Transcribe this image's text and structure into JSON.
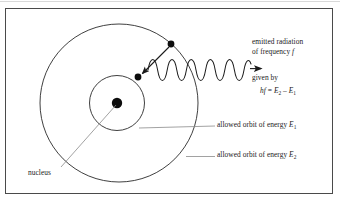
{
  "figure": {
    "background_color": "#ffffff",
    "frame_color": "#4a4a4a",
    "ink_color": "#1a1a1a",
    "leader_color": "#8a8a8a"
  },
  "labels": {
    "emitted_line1": "emitted radiation",
    "emitted_line2_prefix": "of frequency ",
    "emitted_line2_symbol": "f",
    "given_by": "given by",
    "formula": {
      "lhs_h": "h",
      "lhs_f": "f",
      "equals": " = ",
      "term1_base": "E",
      "term1_sub": "2",
      "minus": " – ",
      "term2_base": "E",
      "term2_sub": "1"
    },
    "orbit_e1_text": "allowed orbit of energy ",
    "orbit_e1_symbol": "E",
    "orbit_e1_sub": "1",
    "orbit_e2_text": "allowed orbit of energy ",
    "orbit_e2_symbol": "E",
    "orbit_e2_sub": "2",
    "nucleus": "nucleus"
  },
  "diagram": {
    "nucleus_dot": {
      "cx": 117,
      "cy": 103,
      "r": 5.2
    },
    "inner_orbit": {
      "cx": 117,
      "cy": 103,
      "r": 27.5
    },
    "outer_orbit": {
      "cx": 119,
      "cy": 103,
      "r": 79
    },
    "electron_outer": {
      "cx": 171,
      "cy": 44,
      "r": 3.4
    },
    "electron_inner": {
      "cx": 138,
      "cy": 77,
      "r": 3.4
    },
    "transition_arrow": {
      "x1": 169,
      "y1": 47,
      "x2": 140,
      "y2": 75
    },
    "photon_wave": {
      "start_x": 149,
      "end_x": 252,
      "baseline_y": 70,
      "amplitude": 9,
      "cycles": 7.5,
      "arrow_tip_x": 263
    },
    "leader_e1": {
      "x1": 139,
      "y1": 128,
      "x2": 215,
      "y2": 126
    },
    "leader_e2": {
      "x1": 186,
      "y1": 156,
      "x2": 215,
      "y2": 156
    },
    "leader_nucleus": {
      "x1": 116,
      "y1": 105,
      "x2": 62,
      "y2": 167
    }
  }
}
